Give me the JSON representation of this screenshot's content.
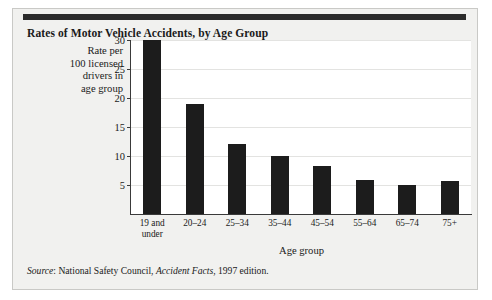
{
  "figure": {
    "title": "Rates of Motor Vehicle Accidents, by Age Group",
    "source_prefix": "Source",
    "source_colon": ": ",
    "source_publisher": "National Safety Council, ",
    "source_work": "Accident Facts",
    "source_suffix": ", 1997 edition.",
    "rule_color": "#2b2b2b",
    "background_color": "#f1f1ef",
    "plot_background": "#ffffff",
    "bar_color": "#1c1c1c",
    "grid_color": "#e3e3e1",
    "axis_color": "#3a3a3a"
  },
  "chart_data": {
    "type": "bar",
    "title": "Rates of Motor Vehicle Accidents, by Age Group",
    "xlabel": "Age group",
    "ylabel": "Rate per 100 licensed drivers in age group",
    "ylabel_lines": [
      "Rate per",
      "100 licensed",
      "drivers in",
      "age group"
    ],
    "categories": [
      "19 and\nunder",
      "20–24",
      "25–34",
      "35–44",
      "45–54",
      "55–64",
      "65–74",
      "75+"
    ],
    "values": [
      30.0,
      19.0,
      12.0,
      10.0,
      8.3,
      5.8,
      5.0,
      5.7
    ],
    "ylim": [
      0,
      30
    ],
    "yticks": [
      5,
      10,
      15,
      20,
      25,
      30
    ],
    "ytick_labels": [
      "5",
      "10",
      "15",
      "20",
      "25",
      "30"
    ],
    "grid": true,
    "grid_axis": "y",
    "legend": false,
    "legend_position": "none"
  }
}
